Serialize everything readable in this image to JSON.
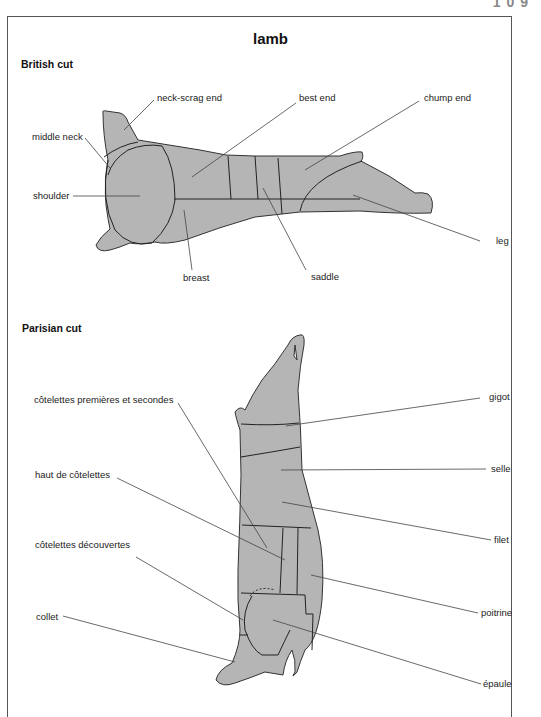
{
  "page_number": "1 0 9",
  "title": "lamb",
  "colors": {
    "fill": "#b5b5b5",
    "stroke": "#333333",
    "leader": "#444444"
  },
  "british": {
    "heading": "British cut",
    "labels": {
      "neck_scrag_end": "neck-scrag end",
      "best_end": "best end",
      "chump_end": "chump end",
      "middle_neck": "middle neck",
      "shoulder": "shoulder",
      "breast": "breast",
      "saddle": "saddle",
      "leg": "leg"
    }
  },
  "parisian": {
    "heading": "Parisian cut",
    "labels": {
      "cotelettes_premieres": "côtelettes premières et secondes",
      "haut_de_cotelettes": "haut de côtelettes",
      "cotelettes_decouvertes": "côtelettes découvertes",
      "collet": "collet",
      "gigot": "gigot",
      "selle": "selle",
      "filet": "filet",
      "poitrine": "poitrine",
      "epaule": "épaule"
    }
  }
}
